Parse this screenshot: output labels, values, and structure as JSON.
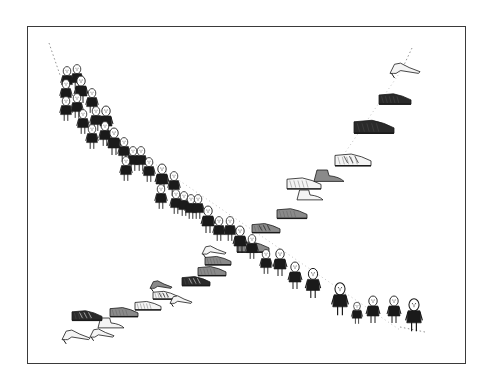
{
  "illustration": {
    "title": "People and shoes crossing paths",
    "caption": "",
    "frame": {
      "x": 27,
      "y": 26,
      "width": 437,
      "height": 336,
      "border_color": "#3a3a3a"
    },
    "ink_color": "#1a1a1a",
    "paper_color": "#ffffff",
    "people_line": {
      "description": "Line of small people descending from top-left to bottom-right, crowded at top, sparser at bottom",
      "dotted_lead_in": {
        "x1": 49,
        "y1": 43,
        "x2": 60,
        "y2": 75
      },
      "dotted_tail": {
        "x1": 400,
        "y1": 327,
        "x2": 425,
        "y2": 332
      },
      "figures": [
        {
          "x": 67,
          "y": 72,
          "s": 0.9
        },
        {
          "x": 77,
          "y": 70,
          "s": 0.9
        },
        {
          "x": 66,
          "y": 85,
          "s": 0.9
        },
        {
          "x": 81,
          "y": 82,
          "s": 1.0
        },
        {
          "x": 66,
          "y": 102,
          "s": 0.9
        },
        {
          "x": 77,
          "y": 99,
          "s": 0.9
        },
        {
          "x": 92,
          "y": 94,
          "s": 0.9
        },
        {
          "x": 83,
          "y": 115,
          "s": 0.9
        },
        {
          "x": 96,
          "y": 112,
          "s": 0.9
        },
        {
          "x": 106,
          "y": 112,
          "s": 1.0
        },
        {
          "x": 92,
          "y": 130,
          "s": 0.9
        },
        {
          "x": 105,
          "y": 127,
          "s": 0.9
        },
        {
          "x": 114,
          "y": 134,
          "s": 1.0
        },
        {
          "x": 124,
          "y": 143,
          "s": 0.9
        },
        {
          "x": 133,
          "y": 152,
          "s": 0.9
        },
        {
          "x": 141,
          "y": 152,
          "s": 0.9
        },
        {
          "x": 126,
          "y": 162,
          "s": 0.9
        },
        {
          "x": 149,
          "y": 163,
          "s": 0.9
        },
        {
          "x": 162,
          "y": 170,
          "s": 1.0
        },
        {
          "x": 174,
          "y": 177,
          "s": 0.9
        },
        {
          "x": 161,
          "y": 190,
          "s": 0.9
        },
        {
          "x": 176,
          "y": 195,
          "s": 0.9
        },
        {
          "x": 184,
          "y": 197,
          "s": 0.9
        },
        {
          "x": 191,
          "y": 200,
          "s": 0.9
        },
        {
          "x": 198,
          "y": 200,
          "s": 0.9
        },
        {
          "x": 208,
          "y": 212,
          "s": 1.0
        },
        {
          "x": 219,
          "y": 222,
          "s": 0.9
        },
        {
          "x": 230,
          "y": 222,
          "s": 0.9
        },
        {
          "x": 240,
          "y": 232,
          "s": 1.0
        },
        {
          "x": 252,
          "y": 240,
          "s": 0.9
        },
        {
          "x": 266,
          "y": 255,
          "s": 0.9
        },
        {
          "x": 280,
          "y": 255,
          "s": 1.0
        },
        {
          "x": 295,
          "y": 268,
          "s": 1.0
        },
        {
          "x": 313,
          "y": 275,
          "s": 1.1
        },
        {
          "x": 340,
          "y": 290,
          "s": 1.2
        },
        {
          "x": 357,
          "y": 307,
          "s": 0.8
        },
        {
          "x": 373,
          "y": 302,
          "s": 1.0
        },
        {
          "x": 394,
          "y": 302,
          "s": 1.0
        },
        {
          "x": 414,
          "y": 306,
          "s": 1.2
        }
      ]
    },
    "shoes_line": {
      "description": "Line of assorted shoes ascending from bottom-left to top-right, crowded at bottom, sparser at top",
      "dotted_lead_in": {
        "x1": 412,
        "y1": 48,
        "x2": 404,
        "y2": 65
      },
      "shoes": [
        {
          "x": 62,
          "y": 329,
          "w": 28,
          "kind": "heel",
          "fill": "light"
        },
        {
          "x": 90,
          "y": 328,
          "w": 24,
          "kind": "heel",
          "fill": "light"
        },
        {
          "x": 98,
          "y": 318,
          "w": 26,
          "kind": "boot",
          "fill": "light"
        },
        {
          "x": 72,
          "y": 309,
          "w": 30,
          "kind": "sneaker",
          "fill": "dark"
        },
        {
          "x": 110,
          "y": 306,
          "w": 28,
          "kind": "loafer",
          "fill": "mid"
        },
        {
          "x": 135,
          "y": 300,
          "w": 26,
          "kind": "loafer",
          "fill": "light"
        },
        {
          "x": 153,
          "y": 290,
          "w": 24,
          "kind": "sneaker",
          "fill": "light"
        },
        {
          "x": 170,
          "y": 295,
          "w": 22,
          "kind": "heel",
          "fill": "light"
        },
        {
          "x": 150,
          "y": 280,
          "w": 22,
          "kind": "heel",
          "fill": "mid"
        },
        {
          "x": 182,
          "y": 275,
          "w": 28,
          "kind": "sneaker",
          "fill": "dark"
        },
        {
          "x": 198,
          "y": 265,
          "w": 28,
          "kind": "loafer",
          "fill": "mid"
        },
        {
          "x": 205,
          "y": 255,
          "w": 26,
          "kind": "loafer",
          "fill": "mid"
        },
        {
          "x": 202,
          "y": 245,
          "w": 24,
          "kind": "heel",
          "fill": "light"
        },
        {
          "x": 237,
          "y": 240,
          "w": 32,
          "kind": "sneaker",
          "fill": "mid"
        },
        {
          "x": 252,
          "y": 222,
          "w": 28,
          "kind": "sneaker",
          "fill": "mid"
        },
        {
          "x": 277,
          "y": 207,
          "w": 30,
          "kind": "loafer",
          "fill": "mid"
        },
        {
          "x": 297,
          "y": 190,
          "w": 26,
          "kind": "boot",
          "fill": "light"
        },
        {
          "x": 287,
          "y": 176,
          "w": 34,
          "kind": "loafer",
          "fill": "light"
        },
        {
          "x": 314,
          "y": 170,
          "w": 30,
          "kind": "boot",
          "fill": "mid"
        },
        {
          "x": 335,
          "y": 152,
          "w": 36,
          "kind": "sneaker",
          "fill": "light"
        },
        {
          "x": 354,
          "y": 118,
          "w": 40,
          "kind": "oxford",
          "fill": "dark"
        },
        {
          "x": 379,
          "y": 92,
          "w": 32,
          "kind": "oxford",
          "fill": "dark"
        },
        {
          "x": 390,
          "y": 62,
          "w": 30,
          "kind": "heel",
          "fill": "light"
        }
      ]
    },
    "crossing_point": {
      "x": 240,
      "y": 245
    }
  }
}
